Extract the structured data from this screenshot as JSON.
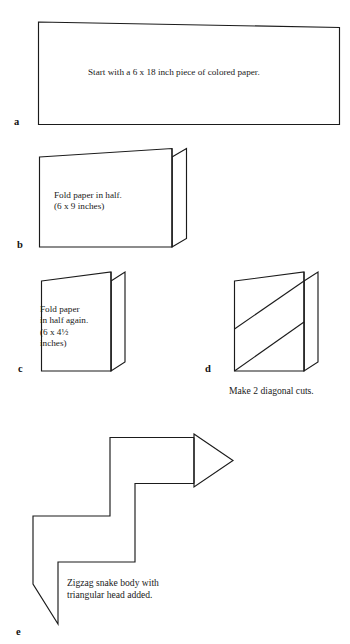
{
  "document": {
    "title": "Paper Zigzag Snake — Folding Instructions",
    "background_color": "#ffffff",
    "ink_color": "#1b1b1b",
    "page_width": 350,
    "page_height": 644
  },
  "steps": [
    {
      "id": "a",
      "label": "a",
      "text": "Start with a 6 x 18 inch piece of colored paper.",
      "shape": "wide-rectangle-sheet"
    },
    {
      "id": "b",
      "label": "b",
      "text": "Fold paper in half.\n(6 x 9 inches)",
      "shape": "folded-sheet-half"
    },
    {
      "id": "c",
      "label": "c",
      "text": "Fold paper\nin half again.\n(6 x 4½\ninches)",
      "shape": "folded-sheet-quarter"
    },
    {
      "id": "d",
      "label": "d",
      "text": "Make 2 diagonal cuts.",
      "shape": "folded-sheet-with-diagonal-cuts",
      "cut_count": 2
    },
    {
      "id": "e",
      "label": "e",
      "text": "Zigzag snake body with\ntriangular head added.",
      "shape": "zigzag-snake-with-triangular-head"
    }
  ],
  "measurements": {
    "start_sheet": "6 x 18 inch",
    "after_first_fold": "6 x 9 inches",
    "after_second_fold": "6 x 4½ inches"
  }
}
